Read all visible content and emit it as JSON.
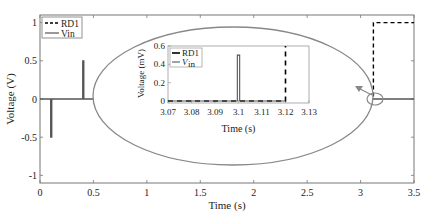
{
  "chart_data": [
    {
      "type": "line",
      "title": "",
      "xlabel": "Time (s)",
      "ylabel": "Voltage (V)",
      "xlim": [
        0,
        3.5
      ],
      "ylim": [
        -1.1,
        1.1
      ],
      "xticks": [
        0,
        0.5,
        1,
        1.5,
        2,
        2.5,
        3,
        3.5
      ],
      "xtick_labels": [
        "0",
        "0.5",
        "1",
        "1.5",
        "2",
        "2.5",
        "3",
        "3.5"
      ],
      "yticks": [
        -1,
        -0.5,
        0,
        0.5,
        1
      ],
      "ytick_labels": [
        "-1",
        "-0.5",
        "0",
        "0.5",
        "1"
      ],
      "grid": false,
      "legend": {
        "placement": "top-left",
        "entries": [
          "RD1",
          "Vin"
        ]
      },
      "series": [
        {
          "name": "RD1",
          "style": "dashed",
          "color": "#000000",
          "x": [
            2.75,
            3.12,
            3.12,
            3.5
          ],
          "y": [
            0,
            0,
            1,
            1
          ]
        },
        {
          "name": "Vin",
          "style": "solid",
          "color": "#555555",
          "x": [
            0,
            0.1,
            0.1,
            0.11,
            0.11,
            0.4,
            0.4,
            0.41,
            0.41,
            0.95,
            3.05,
            3.5
          ],
          "y": [
            0,
            0,
            -0.5,
            -0.5,
            0,
            0,
            0.5,
            0.5,
            0,
            0,
            0,
            0
          ]
        }
      ],
      "annotations": [
        "ellipse zoom highlight around t≈3.1 s with arrow to inset"
      ]
    },
    {
      "type": "line",
      "title": "",
      "xlabel": "Time (s)",
      "ylabel": "Voltage (mV)",
      "ylabel_display": "Voltage (mV)",
      "xlim": [
        3.07,
        3.13
      ],
      "ylim": [
        -0.02,
        0.6
      ],
      "xticks": [
        3.07,
        3.08,
        3.09,
        3.1,
        3.11,
        3.12,
        3.13
      ],
      "xtick_labels": [
        "3.07",
        "3.08",
        "3.09",
        "3.1",
        "3.11",
        "3.12",
        "3.13"
      ],
      "yticks": [
        0,
        0.2,
        0.4,
        0.6
      ],
      "ytick_labels": [
        "0",
        "0.2",
        "0.4",
        "0.6"
      ],
      "grid": false,
      "legend": {
        "placement": "top-left",
        "entries": [
          "RD1",
          "Vin"
        ]
      },
      "series": [
        {
          "name": "RD1",
          "style": "dashed",
          "color": "#000000",
          "x": [
            3.07,
            3.12,
            3.12
          ],
          "y": [
            0,
            0,
            0.6
          ]
        },
        {
          "name": "Vin",
          "style": "solid",
          "color": "#555555",
          "x": [
            3.07,
            3.0995,
            3.0995,
            3.1005,
            3.1005,
            3.12
          ],
          "y": [
            0,
            0,
            0.5,
            0.5,
            0,
            0
          ]
        }
      ]
    }
  ],
  "legend_main": {
    "rd1": "RD1",
    "vin": "Vin"
  },
  "legend_inset": {
    "rd1": "RD1",
    "vin_main": "V",
    "vin_sub": "in"
  }
}
